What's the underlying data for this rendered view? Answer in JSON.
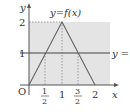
{
  "figure": {
    "function_label": "y=f(x)",
    "line_label": "y =",
    "axis_labels": {
      "x": "x",
      "y": "y",
      "origin": "O"
    },
    "y_ticks": [
      {
        "value": 2,
        "label": "2"
      },
      {
        "value": 1,
        "label": "1"
      }
    ],
    "x_ticks": [
      {
        "value": 0.5,
        "numerator": "1",
        "denominator": "2"
      },
      {
        "value": 1,
        "label": "1"
      },
      {
        "value": 1.5,
        "numerator": "3",
        "denominator": "2"
      },
      {
        "value": 2,
        "label": "2"
      }
    ],
    "graph": {
      "type": "piecewise-linear",
      "points": [
        [
          0,
          0
        ],
        [
          1,
          2
        ],
        [
          2,
          0
        ]
      ],
      "horizontal_line_y": 1,
      "shaded_region": {
        "x": [
          0,
          2.3
        ],
        "y": [
          0,
          2
        ]
      }
    },
    "colors": {
      "shade": "#e4e4e4",
      "axis": "#555555",
      "curve": "#666666",
      "hline": "#444444",
      "dashed": "#888888"
    }
  }
}
